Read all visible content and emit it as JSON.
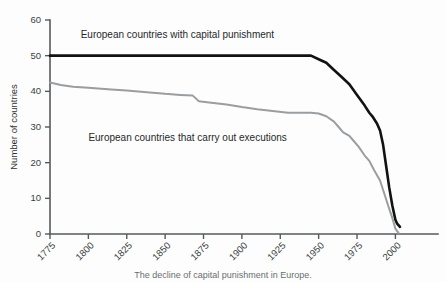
{
  "chart_data": {
    "type": "line",
    "title": "",
    "xlabel": "",
    "ylabel": "Number of countries",
    "xlim": [
      1775,
      2003
    ],
    "ylim": [
      0,
      60
    ],
    "grid": false,
    "legend_position": "inline-annotations",
    "xticks": [
      "1775",
      "1800",
      "1825",
      "1850",
      "1875",
      "1900",
      "1925",
      "1950",
      "1975",
      "2000"
    ],
    "xtick_values": [
      1775,
      1800,
      1825,
      1850,
      1875,
      1900,
      1925,
      1950,
      1975,
      2000
    ],
    "yticks": [
      "0",
      "10",
      "20",
      "30",
      "40",
      "50",
      "60"
    ],
    "ytick_values": [
      0,
      10,
      20,
      30,
      40,
      50,
      60
    ],
    "series": [
      {
        "name": "European countries with capital punishment",
        "color": "#121212",
        "label_x": 1795,
        "label_y": 55,
        "x": [
          1775,
          1800,
          1825,
          1850,
          1875,
          1900,
          1915,
          1925,
          1935,
          1945,
          1950,
          1955,
          1960,
          1965,
          1970,
          1975,
          1980,
          1983,
          1985,
          1988,
          1990,
          1992,
          1994,
          1996,
          1998,
          2000,
          2001,
          2003
        ],
        "values": [
          50,
          50,
          50,
          50,
          50,
          50,
          50,
          50,
          50,
          50,
          49,
          48,
          46,
          44,
          42,
          39,
          36,
          34,
          33,
          31,
          29,
          25,
          19,
          13,
          8,
          4,
          3,
          2
        ]
      },
      {
        "name": "European countries that carry out executions",
        "color": "#9a9ea1",
        "label_x": 1800,
        "label_y": 26,
        "x": [
          1775,
          1782,
          1790,
          1800,
          1815,
          1825,
          1840,
          1850,
          1860,
          1868,
          1872,
          1880,
          1890,
          1900,
          1910,
          1920,
          1930,
          1940,
          1945,
          1950,
          1955,
          1960,
          1963,
          1966,
          1970,
          1973,
          1976,
          1980,
          1983,
          1986,
          1990,
          1993,
          1996,
          1998,
          2000,
          2002
        ],
        "values": [
          42.5,
          41.8,
          41.3,
          41,
          40.5,
          40.2,
          39.7,
          39.3,
          39,
          38.8,
          37.2,
          36.8,
          36.3,
          35.6,
          35,
          34.5,
          34,
          34,
          34,
          33.8,
          33,
          31.5,
          30,
          28.5,
          27.5,
          26,
          24.5,
          22,
          20.5,
          18,
          15,
          11,
          7,
          4.5,
          1.5,
          0.3
        ]
      }
    ]
  },
  "caption": {
    "text": "The decline of capital punishment in Europe."
  }
}
